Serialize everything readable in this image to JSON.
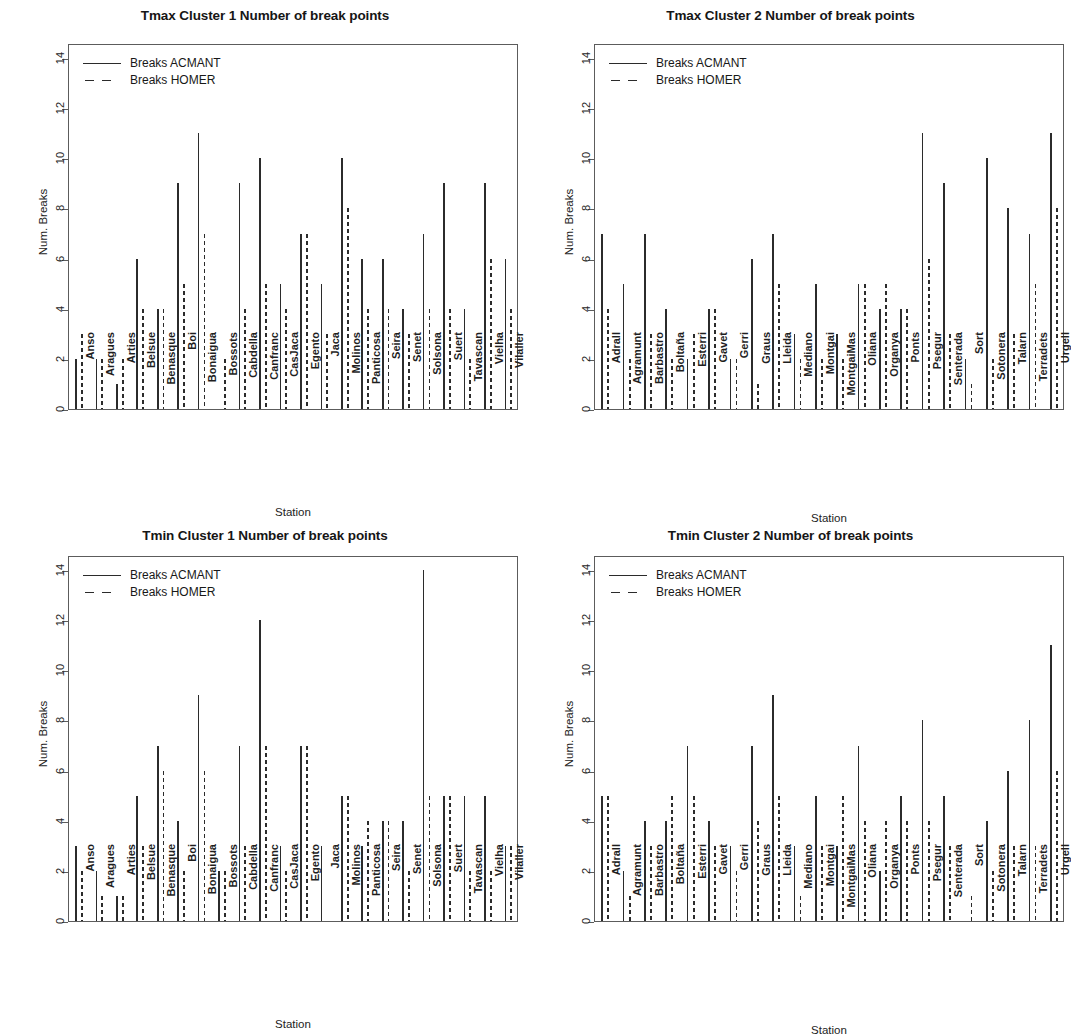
{
  "figure": {
    "panels": [
      "tmax_c1",
      "tmax_c2",
      "tmin_c1",
      "tmin_c2"
    ],
    "legend_labels": {
      "acmant": "Breaks ACMANT",
      "homer": "Breaks HOMER"
    },
    "axis_titles": {
      "x": "Station",
      "y": "Num. Breaks"
    },
    "y_ticks": [
      "0",
      "2",
      "4",
      "6",
      "8",
      "10",
      "12",
      "14"
    ]
  },
  "chart_data": [
    {
      "id": "tmax_c1",
      "type": "bar",
      "title": "Tmax Cluster 1 Number of break points",
      "xlabel": "Station",
      "ylabel": "Num. Breaks",
      "ylim": [
        0,
        14.6
      ],
      "yticks": [
        0,
        2,
        4,
        6,
        8,
        10,
        12,
        14
      ],
      "grid": false,
      "legend_position": "top-left",
      "categories": [
        "Anso",
        "Aragues",
        "Arties",
        "Belsue",
        "Benasque",
        "Boi",
        "Bonaigua",
        "Bossots",
        "Cabdella",
        "Canfranc",
        "CasJaca",
        "Egento",
        "Jaca",
        "Molinos",
        "Panticosa",
        "Seira",
        "Senet",
        "Solsona",
        "Suert",
        "Tavascan",
        "Vielha",
        "Vilaller"
      ],
      "series": [
        {
          "name": "Breaks ACMANT",
          "style": "solid",
          "values": [
            2,
            2,
            1,
            6,
            4,
            9,
            11,
            0,
            9,
            10,
            5,
            7,
            5,
            10,
            6,
            6,
            4,
            7,
            9,
            4,
            9,
            6
          ]
        },
        {
          "name": "Breaks HOMER",
          "style": "dashed",
          "values": [
            3,
            2,
            2,
            4,
            4,
            5,
            7,
            2,
            4,
            5,
            4,
            7,
            3,
            8,
            4,
            4,
            3,
            4,
            4,
            2,
            6,
            4
          ]
        }
      ]
    },
    {
      "id": "tmax_c2",
      "type": "bar",
      "title": "Tmax Cluster 2 Number of break points",
      "xlabel": "Station",
      "ylabel": "Num. Breaks",
      "ylim": [
        0,
        14.6
      ],
      "yticks": [
        0,
        2,
        4,
        6,
        8,
        10,
        12,
        14
      ],
      "grid": false,
      "legend_position": "top-left",
      "categories": [
        "Adrall",
        "Agramunt",
        "Barbastro",
        "Boltaña",
        "Esterri",
        "Gavet",
        "Gerri",
        "Graus",
        "Lleida",
        "Mediano",
        "Montgai",
        "MontgaiMas",
        "Oliana",
        "Organya",
        "Ponts",
        "Psegur",
        "Senterada",
        "Sort",
        "Sotonera",
        "Talarn",
        "Terradets",
        "Urgell"
      ],
      "series": [
        {
          "name": "Breaks ACMANT",
          "style": "solid",
          "values": [
            7,
            5,
            7,
            4,
            2,
            4,
            2,
            6,
            7,
            3,
            5,
            3,
            5,
            4,
            4,
            11,
            9,
            2,
            10,
            8,
            7,
            11
          ]
        },
        {
          "name": "Breaks HOMER",
          "style": "dashed",
          "values": [
            4,
            2,
            3,
            2,
            3,
            4,
            2,
            1,
            5,
            2,
            2,
            2,
            5,
            5,
            4,
            6,
            3,
            1,
            2,
            3,
            5,
            8
          ]
        }
      ]
    },
    {
      "id": "tmin_c1",
      "type": "bar",
      "title": "Tmin Cluster 1 Number of break points",
      "xlabel": "Station",
      "ylabel": "Num. Breaks",
      "ylim": [
        0,
        14.6
      ],
      "yticks": [
        0,
        2,
        4,
        6,
        8,
        10,
        12,
        14
      ],
      "grid": false,
      "legend_position": "top-left",
      "categories": [
        "Anso",
        "Aragues",
        "Arties",
        "Belsue",
        "Benasque",
        "Boi",
        "Bonaigua",
        "Bossots",
        "Cabdella",
        "Canfranc",
        "CasJaca",
        "Egento",
        "Jaca",
        "Molinos",
        "Panticosa",
        "Seira",
        "Senet",
        "Solsona",
        "Suert",
        "Tavascan",
        "Vielha",
        "Vilaller"
      ],
      "series": [
        {
          "name": "Breaks ACMANT",
          "style": "solid",
          "values": [
            3,
            2,
            1,
            5,
            7,
            4,
            9,
            2,
            7,
            12,
            3,
            7,
            3,
            5,
            3,
            4,
            4,
            14,
            5,
            5,
            5,
            3
          ]
        },
        {
          "name": "Breaks HOMER",
          "style": "dashed",
          "values": [
            2,
            1,
            1,
            3,
            6,
            2,
            6,
            2,
            3,
            7,
            2,
            7,
            0,
            5,
            4,
            4,
            2,
            5,
            5,
            2,
            2,
            3
          ]
        }
      ]
    },
    {
      "id": "tmin_c2",
      "type": "bar",
      "title": "Tmin Cluster 2 Number of break points",
      "xlabel": "Station",
      "ylabel": "Num. Breaks",
      "ylim": [
        0,
        14.6
      ],
      "yticks": [
        0,
        2,
        4,
        6,
        8,
        10,
        12,
        14
      ],
      "grid": false,
      "legend_position": "top-left",
      "categories": [
        "Adrall",
        "Agramunt",
        "Barbastro",
        "Boltaña",
        "Esterri",
        "Gavet",
        "Gerri",
        "Graus",
        "Lleida",
        "Mediano",
        "Montgai",
        "MontgaiMas",
        "Oliana",
        "Organya",
        "Ponts",
        "Psegur",
        "Senterada",
        "Sort",
        "Sotonera",
        "Talarn",
        "Terradets",
        "Urgell"
      ],
      "series": [
        {
          "name": "Breaks ACMANT",
          "style": "solid",
          "values": [
            5,
            2,
            4,
            4,
            7,
            4,
            3,
            7,
            9,
            3,
            5,
            3,
            7,
            2,
            5,
            8,
            5,
            0,
            4,
            6,
            8,
            11
          ]
        },
        {
          "name": "Breaks HOMER",
          "style": "dashed",
          "values": [
            5,
            1,
            3,
            5,
            5,
            3,
            2,
            4,
            5,
            1,
            3,
            5,
            4,
            4,
            4,
            4,
            3,
            1,
            2,
            3,
            3,
            6
          ]
        }
      ]
    }
  ]
}
